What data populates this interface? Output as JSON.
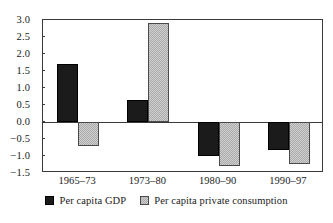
{
  "chart_data": {
    "type": "bar",
    "title": "",
    "xlabel": "",
    "ylabel": "",
    "categories": [
      "1965–73",
      "1973–80",
      "1980–90",
      "1990–97"
    ],
    "series": [
      {
        "name": "Per capita GDP",
        "color": "#1b1b1b",
        "values": [
          1.7,
          0.65,
          -1.0,
          -0.82
        ]
      },
      {
        "name": "Per capita private consumption",
        "color": "#ababab",
        "values": [
          -0.7,
          2.9,
          -1.3,
          -1.23
        ]
      }
    ],
    "ylim": [
      -1.5,
      3.0
    ],
    "yticks": [
      "3.0",
      "2.5",
      "2.0",
      "1.5",
      "1.0",
      "0.5",
      "0.0",
      "−0.5",
      "−1.0",
      "−1.5"
    ],
    "ytick_values": [
      3.0,
      2.5,
      2.0,
      1.5,
      1.0,
      0.5,
      0.0,
      -0.5,
      -1.0,
      -1.5
    ],
    "grid": false,
    "legend_position": "bottom",
    "zero_line": 0
  }
}
